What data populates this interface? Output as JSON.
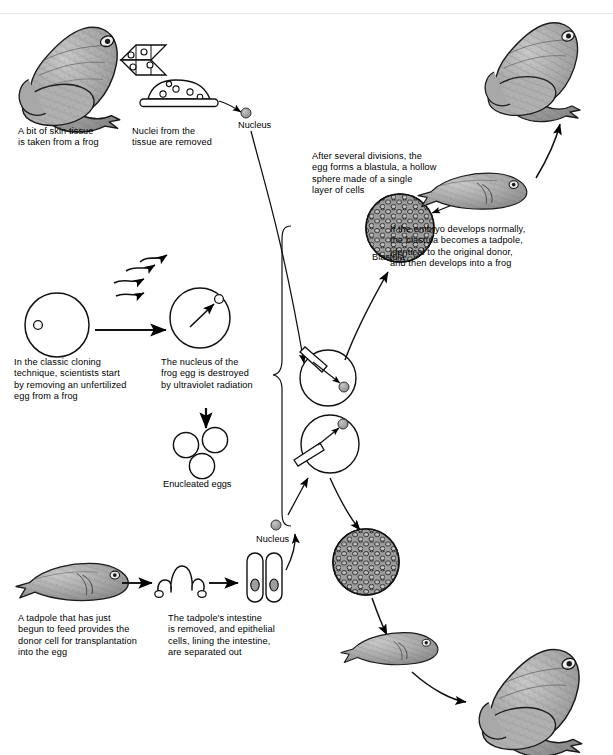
{
  "diagram": {
    "background": "#ffffff",
    "ink": "#000000",
    "fill_gray": "#9a9a9a",
    "captions": [
      {
        "id": "skin_tissue",
        "text": "A bit of skin tissue\nis taken from a frog",
        "x": 18,
        "y": 126
      },
      {
        "id": "nuclei_removed",
        "text": "Nuclei from the\ntissue are removed",
        "x": 132,
        "y": 126
      },
      {
        "id": "classic_technique",
        "text": "In the classic cloning\ntechnique, scientists start\nby removing an unfertilized\negg from a frog",
        "x": 14,
        "y": 357
      },
      {
        "id": "uv_destroyed",
        "text": "The nucleus of the\nfrog egg is destroyed\nby ultraviolet radiation",
        "x": 161,
        "y": 357
      },
      {
        "id": "after_divisions",
        "text": "After several divisions, the\negg forms a blastula, a hollow\nsphere made of a single\nlayer of cells",
        "x": 312,
        "y": 151
      },
      {
        "id": "embryo_normal",
        "text": "If the embryo develops normally,\nthe blastula becomes a tadpole,\nidentical to the original donor,\nand then develops into a frog",
        "x": 390,
        "y": 224
      },
      {
        "id": "tadpole_donor",
        "text": "A tadpole that has just\nbegun to feed provides the\ndonor cell for transplantation\ninto the egg",
        "x": 18,
        "y": 613
      },
      {
        "id": "intestine_removed",
        "text": "The tadpole's intestine\nis removed, and epithelial\ncells, lining the intestine,\nare separated out",
        "x": 168,
        "y": 613
      }
    ],
    "labels": [
      {
        "id": "nucleus_top",
        "text": "Nucleus",
        "x": 238,
        "y": 120
      },
      {
        "id": "enucleated",
        "text": "Enucleated eggs",
        "x": 163,
        "y": 479
      },
      {
        "id": "blastula_top",
        "text": "Blastula",
        "x": 372,
        "y": 252
      },
      {
        "id": "nucleus_bottom",
        "text": "Nucleus",
        "x": 256,
        "y": 534
      }
    ],
    "structures": [
      {
        "id": "donor-frog",
        "kind": "frog",
        "label": "Adult donor frog (skin tissue source)"
      },
      {
        "id": "chromosome-cluster",
        "kind": "cells",
        "label": "Tissue cells with nuclei"
      },
      {
        "id": "tissue-dish",
        "kind": "dish",
        "label": "Culture dish of tissue"
      },
      {
        "id": "unfertilized-egg",
        "kind": "egg",
        "label": "Unfertilized frog egg with nucleus"
      },
      {
        "id": "uv-irradiated-egg",
        "kind": "egg",
        "label": "Frog egg irradiated by ultraviolet light"
      },
      {
        "id": "enucleated-eggs",
        "kind": "eggs",
        "label": "Three enucleated eggs"
      },
      {
        "id": "injected-egg-upper",
        "kind": "injection",
        "label": "Skin-cell nucleus injected into enucleated egg"
      },
      {
        "id": "injected-egg-lower",
        "kind": "injection",
        "label": "Intestine-cell nucleus injected into enucleated egg"
      },
      {
        "id": "blastula-upper",
        "kind": "blastula",
        "label": "Blastula from skin-nucleus transfer"
      },
      {
        "id": "blastula-lower",
        "kind": "blastula",
        "label": "Blastula from intestine-nucleus transfer"
      },
      {
        "id": "tadpole-upper",
        "kind": "tadpole",
        "label": "Tadpole developed from blastula"
      },
      {
        "id": "tadpole-lower",
        "kind": "tadpole",
        "label": "Cloned tadpole"
      },
      {
        "id": "adult-frog-upper",
        "kind": "frog",
        "label": "Cloned adult frog (top right)"
      },
      {
        "id": "adult-frog-lower",
        "kind": "frog",
        "label": "Cloned adult frog (bottom right)"
      },
      {
        "id": "donor-tadpole",
        "kind": "tadpole",
        "label": "Feeding tadpole, donor cell source"
      },
      {
        "id": "intestine",
        "kind": "intestine",
        "label": "Excised tadpole intestine"
      },
      {
        "id": "epithelial-cells",
        "kind": "cells",
        "label": "Epithelial cells lining the intestine"
      },
      {
        "id": "brace",
        "kind": "brace",
        "label": "Brace grouping enucleated eggs to injections"
      }
    ]
  }
}
